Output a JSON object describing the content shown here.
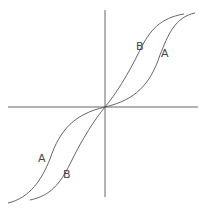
{
  "diagram": {
    "title": "",
    "axes": {
      "color": "#555555"
    },
    "curve_color": "#555555",
    "curves": [
      {
        "name": "A",
        "label": "A"
      },
      {
        "name": "B",
        "label": "B"
      }
    ],
    "labels": {
      "b_upper": "B",
      "a_upper": "A",
      "a_lower": "A",
      "b_lower": "B"
    }
  }
}
